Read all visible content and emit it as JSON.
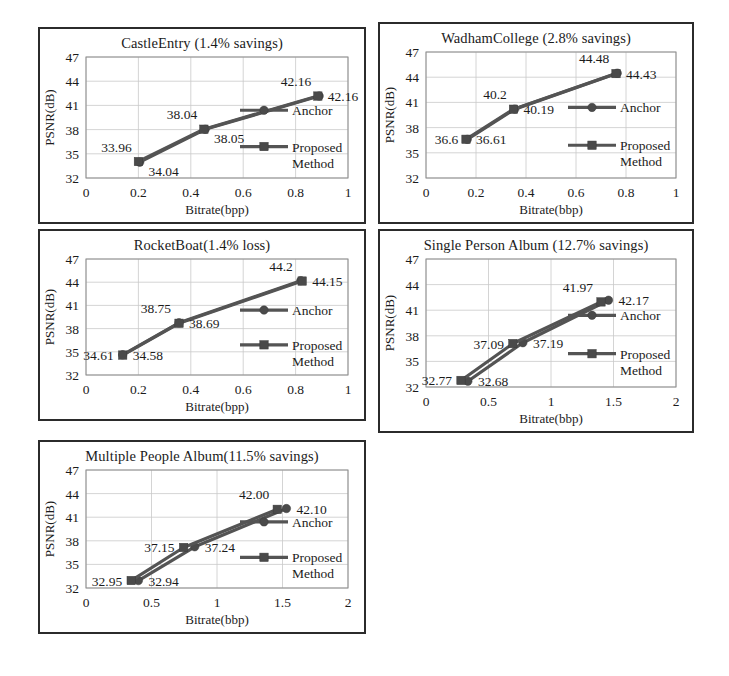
{
  "figure": {
    "background_color": "#ffffff",
    "panel_border_color": "#2b2b2b",
    "series_color": "#545454",
    "grid_color": "#c9c9c9",
    "text_color": "#1b1b1b"
  },
  "chart_data": [
    {
      "id": "castle-entry",
      "type": "line",
      "title": "CastleEntry (1.4% savings)",
      "xlabel": "Bitrate(bpp)",
      "ylabel": "PSNR(dB)",
      "xlim": [
        0,
        1
      ],
      "ylim": [
        32,
        47
      ],
      "xticks": [
        "0",
        "0.2",
        "0.4",
        "0.6",
        "0.8",
        "1"
      ],
      "xtick_values": [
        0,
        0.2,
        0.4,
        0.6,
        0.8,
        1
      ],
      "yticks": [
        "47",
        "44",
        "41",
        "38",
        "35",
        "32"
      ],
      "ytick_values": [
        47,
        44,
        41,
        38,
        35,
        32
      ],
      "grid": true,
      "legend_position": "inside-right",
      "series": [
        {
          "name": "Anchor",
          "marker": "circle",
          "x": [
            0.205,
            0.455,
            0.89
          ],
          "y": [
            33.96,
            38.04,
            42.16
          ],
          "labels": [
            "33.96",
            "38.04",
            "42.16"
          ],
          "label_positions": [
            "above-left",
            "above-left",
            "above-left"
          ]
        },
        {
          "name": "Proposed Method",
          "marker": "square",
          "x": [
            0.2,
            0.45,
            0.885
          ],
          "y": [
            34.04,
            38.05,
            42.16
          ],
          "labels": [
            "34.04",
            "38.05",
            "42.16"
          ],
          "label_positions": [
            "below-right",
            "below-right",
            "right"
          ]
        }
      ]
    },
    {
      "id": "wadham-college",
      "type": "line",
      "title": "WadhamCollege (2.8% savings)",
      "xlabel": "Bitrate(bbp)",
      "ylabel": "PSNR(dB)",
      "xlim": [
        0,
        1
      ],
      "ylim": [
        32,
        47
      ],
      "xticks": [
        "0",
        "0.2",
        "0.4",
        "0.6",
        "0.8",
        "1"
      ],
      "xtick_values": [
        0,
        0.2,
        0.4,
        0.6,
        0.8,
        1
      ],
      "yticks": [
        "47",
        "44",
        "41",
        "38",
        "35",
        "32"
      ],
      "ytick_values": [
        47,
        44,
        41,
        38,
        35,
        32
      ],
      "grid": true,
      "legend_position": "inside-right",
      "series": [
        {
          "name": "Anchor",
          "marker": "circle",
          "x": [
            0.165,
            0.355,
            0.765
          ],
          "y": [
            36.6,
            40.2,
            44.48
          ],
          "labels": [
            "36.6",
            "40.2",
            "44.48"
          ],
          "label_positions": [
            "left",
            "above-left",
            "above-left"
          ]
        },
        {
          "name": "Proposed Method",
          "marker": "square",
          "x": [
            0.16,
            0.35,
            0.76
          ],
          "y": [
            36.61,
            40.19,
            44.43
          ],
          "labels": [
            "36.61",
            "40.19",
            "44.43"
          ],
          "label_positions": [
            "right",
            "right",
            "right"
          ]
        }
      ]
    },
    {
      "id": "rocket-boat",
      "type": "line",
      "title": "RocketBoat(1.4% loss)",
      "xlabel": "Bitrate(bpp)",
      "ylabel": "PSNR(dB)",
      "xlim": [
        0,
        1
      ],
      "ylim": [
        32,
        47
      ],
      "xticks": [
        "0",
        "0.2",
        "0.4",
        "0.6",
        "0.8",
        "1"
      ],
      "xtick_values": [
        0,
        0.2,
        0.4,
        0.6,
        0.8,
        1
      ],
      "yticks": [
        "47",
        "44",
        "41",
        "38",
        "35",
        "32"
      ],
      "ytick_values": [
        47,
        44,
        41,
        38,
        35,
        32
      ],
      "grid": true,
      "legend_position": "inside-right",
      "series": [
        {
          "name": "Anchor",
          "marker": "circle",
          "x": [
            0.14,
            0.355,
            0.82
          ],
          "y": [
            34.61,
            38.75,
            44.2
          ],
          "labels": [
            "34.61",
            "38.75",
            "44.2"
          ],
          "label_positions": [
            "left",
            "above-left",
            "above-left"
          ]
        },
        {
          "name": "Proposed Method",
          "marker": "square",
          "x": [
            0.14,
            0.355,
            0.825
          ],
          "y": [
            34.58,
            38.69,
            44.15
          ],
          "labels": [
            "34.58",
            "38.69",
            "44.15"
          ],
          "label_positions": [
            "right",
            "right",
            "right"
          ]
        }
      ]
    },
    {
      "id": "single-person-album",
      "type": "line",
      "title": "Single Person Album (12.7% savings)",
      "xlabel": "Bitrate(bbp)",
      "ylabel": "PSNR(dB)",
      "xlim": [
        0,
        2
      ],
      "ylim": [
        32,
        47
      ],
      "xticks": [
        "0",
        "0.5",
        "1",
        "1.5",
        "2"
      ],
      "xtick_values": [
        0,
        0.5,
        1,
        1.5,
        2
      ],
      "yticks": [
        "47",
        "44",
        "41",
        "38",
        "35",
        "32"
      ],
      "ytick_values": [
        47,
        44,
        41,
        38,
        35,
        32
      ],
      "grid": true,
      "legend_position": "inside-right",
      "series": [
        {
          "name": "Anchor",
          "marker": "circle",
          "x": [
            0.335,
            0.775,
            1.46
          ],
          "y": [
            32.68,
            37.19,
            42.17
          ],
          "labels": [
            "32.68",
            "37.19",
            "42.17"
          ],
          "label_positions": [
            "right",
            "right",
            "right"
          ]
        },
        {
          "name": "Proposed Method",
          "marker": "square",
          "x": [
            0.28,
            0.695,
            1.4
          ],
          "y": [
            32.77,
            37.09,
            41.97
          ],
          "labels": [
            "32.77",
            "37.09",
            "41.97"
          ],
          "label_positions": [
            "left",
            "left",
            "above-left"
          ]
        }
      ]
    },
    {
      "id": "multiple-people-album",
      "type": "line",
      "title": "Multiple People Album(11.5% savings)",
      "xlabel": "Bitrate(bbp)",
      "ylabel": "PSNR(dB)",
      "xlim": [
        0,
        2
      ],
      "ylim": [
        32,
        47
      ],
      "xticks": [
        "0",
        "0.5",
        "1",
        "1.5",
        "2"
      ],
      "xtick_values": [
        0,
        0.5,
        1,
        1.5,
        2
      ],
      "yticks": [
        "47",
        "44",
        "41",
        "38",
        "35",
        "32"
      ],
      "ytick_values": [
        47,
        44,
        41,
        38,
        35,
        32
      ],
      "grid": true,
      "legend_position": "inside-right",
      "series": [
        {
          "name": "Anchor",
          "marker": "circle",
          "x": [
            0.4,
            0.83,
            1.53
          ],
          "y": [
            32.94,
            37.24,
            42.1
          ],
          "labels": [
            "32.94",
            "37.24",
            "42.10"
          ],
          "label_positions": [
            "right",
            "right",
            "right"
          ]
        },
        {
          "name": "Proposed Method",
          "marker": "square",
          "x": [
            0.345,
            0.745,
            1.46
          ],
          "y": [
            32.95,
            37.15,
            42.0
          ],
          "labels": [
            "32.95",
            "37.15",
            "42.00"
          ],
          "label_positions": [
            "left",
            "left",
            "above-left"
          ]
        }
      ]
    }
  ],
  "panels": [
    {
      "id": "castle-entry",
      "left": 38,
      "top": 27,
      "width": 328,
      "height": 197
    },
    {
      "id": "wadham-college",
      "left": 378,
      "top": 22,
      "width": 316,
      "height": 202
    },
    {
      "id": "rocket-boat",
      "left": 38,
      "top": 229,
      "width": 328,
      "height": 192
    },
    {
      "id": "single-person-album",
      "left": 378,
      "top": 229,
      "width": 316,
      "height": 204
    },
    {
      "id": "multiple-people-album",
      "left": 38,
      "top": 440,
      "width": 328,
      "height": 194
    }
  ]
}
